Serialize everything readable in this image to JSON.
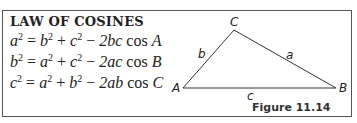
{
  "title": "LAW OF COSINES",
  "equations": [
    {
      "lhs": "a",
      "t1": "b",
      "t2": "c",
      "coef": "2bc",
      "angle": "A"
    },
    {
      "lhs": "b",
      "t1": "a",
      "t2": "c",
      "coef": "2ac",
      "angle": "B"
    },
    {
      "lhs": "c",
      "t1": "a",
      "t2": "b",
      "coef": "2ab",
      "angle": "C"
    }
  ],
  "figure": {
    "vertices": {
      "A": "A",
      "B": "B",
      "C": "C"
    },
    "sides": {
      "a": "a",
      "b": "b",
      "c": "c"
    },
    "caption": "Figure 11.14"
  }
}
